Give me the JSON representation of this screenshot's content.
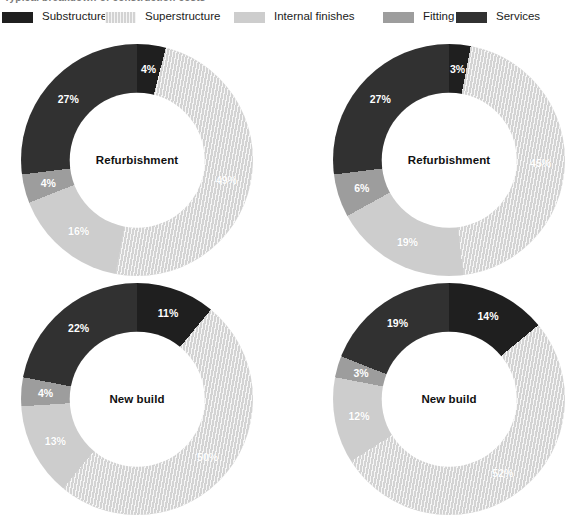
{
  "figure": {
    "cutoff_title": "Typical breakdown of construction costs",
    "background": "#ffffff"
  },
  "legend": {
    "position": "top",
    "items": [
      {
        "label": "Substructure",
        "color": "#1f1f1f",
        "swatch_class": "sw-substructure",
        "icon": "legend-swatch-substructure"
      },
      {
        "label": "Superstructure",
        "color": "#d3d3d3",
        "swatch_class": "sw-superstructure",
        "icon": "legend-swatch-superstructure"
      },
      {
        "label": "Internal finishes",
        "color": "#cdcdcd",
        "swatch_class": "sw-internal",
        "icon": "legend-swatch-internal-finishes"
      },
      {
        "label": "Fitting",
        "color": "#9d9d9d",
        "swatch_class": "sw-fitting",
        "icon": "legend-swatch-fitting"
      },
      {
        "label": "Services",
        "color": "#313131",
        "swatch_class": "sw-services",
        "icon": "legend-swatch-services"
      }
    ]
  },
  "chart_data": [
    {
      "id": "chart-top-left",
      "type": "pie",
      "variant": "donut",
      "title": "Refurbishment",
      "categories": [
        "Substructure",
        "Superstructure",
        "Internal finishes",
        "Fitting",
        "Services"
      ],
      "values": [
        4,
        49,
        16,
        4,
        27
      ],
      "labels": [
        "4%",
        "49%",
        "16%",
        "4%",
        "27%"
      ],
      "colors": [
        "#1f1f1f",
        "#d3d3d3",
        "#cdcdcd",
        "#9d9d9d",
        "#313131"
      ],
      "hatched_slice_index": 1,
      "start_angle_deg": 0,
      "legend": "shared-top"
    },
    {
      "id": "chart-top-right",
      "type": "pie",
      "variant": "donut",
      "title": "Refurbishment",
      "categories": [
        "Substructure",
        "Superstructure",
        "Internal finishes",
        "Fitting",
        "Services"
      ],
      "values": [
        3,
        45,
        19,
        6,
        27
      ],
      "labels": [
        "3%",
        "45%",
        "19%",
        "6%",
        "27%"
      ],
      "colors": [
        "#1f1f1f",
        "#d3d3d3",
        "#cdcdcd",
        "#9d9d9d",
        "#313131"
      ],
      "hatched_slice_index": 1,
      "start_angle_deg": 0,
      "legend": "shared-top",
      "clipped_right_edge": true
    },
    {
      "id": "chart-bottom-left",
      "type": "pie",
      "variant": "donut",
      "title": "New build",
      "categories": [
        "Substructure",
        "Superstructure",
        "Internal finishes",
        "Fitting",
        "Services"
      ],
      "values": [
        11,
        50,
        13,
        4,
        22
      ],
      "labels": [
        "11%",
        "50%",
        "13%",
        "4%",
        "22%"
      ],
      "colors": [
        "#1f1f1f",
        "#d3d3d3",
        "#cdcdcd",
        "#9d9d9d",
        "#313131"
      ],
      "hatched_slice_index": 1,
      "start_angle_deg": 0,
      "legend": "shared-top",
      "clipped_bottom_edge": true
    },
    {
      "id": "chart-bottom-right",
      "type": "pie",
      "variant": "donut",
      "title": "New build",
      "categories": [
        "Substructure",
        "Superstructure",
        "Internal finishes",
        "Fitting",
        "Services"
      ],
      "values": [
        14,
        52,
        12,
        3,
        19
      ],
      "labels": [
        "14%",
        "52%",
        "12%",
        "3%",
        "19%"
      ],
      "colors": [
        "#1f1f1f",
        "#d3d3d3",
        "#cdcdcd",
        "#9d9d9d",
        "#313131"
      ],
      "hatched_slice_index": 1,
      "start_angle_deg": 0,
      "legend": "shared-top",
      "clipped_right_edge": true,
      "clipped_bottom_edge": true
    }
  ]
}
